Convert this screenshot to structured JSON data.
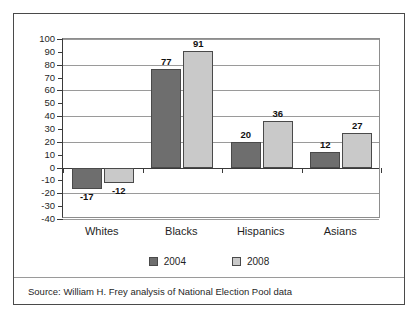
{
  "chart_data": {
    "type": "bar",
    "title": "",
    "xlabel": "",
    "ylabel": "",
    "categories": [
      "Whites",
      "Blacks",
      "Hispanics",
      "Asians"
    ],
    "series": [
      {
        "name": "2004",
        "color": "#6e6e6e",
        "values": [
          -17,
          77,
          20,
          12
        ]
      },
      {
        "name": "2008",
        "color": "#c9c9c9",
        "values": [
          -12,
          91,
          36,
          27
        ]
      }
    ],
    "ylim": [
      -40,
      100
    ],
    "yticks": [
      100,
      90,
      80,
      70,
      60,
      50,
      40,
      30,
      20,
      10,
      0,
      -10,
      -20,
      -30,
      -40
    ],
    "gridlines": [
      100,
      80,
      60,
      40,
      20,
      0,
      -20,
      -40
    ],
    "grid": true,
    "legend_position": "bottom",
    "data_labels": {
      "2004": [
        "-17",
        "77",
        "20",
        "12"
      ],
      "2008": [
        "-12",
        "91",
        "36",
        "27"
      ]
    }
  },
  "legend": {
    "items": [
      {
        "label": "2004",
        "color": "#6e6e6e"
      },
      {
        "label": "2008",
        "color": "#c9c9c9"
      }
    ]
  },
  "source": {
    "text": "Source: William H. Frey analysis of National Election Pool data"
  }
}
